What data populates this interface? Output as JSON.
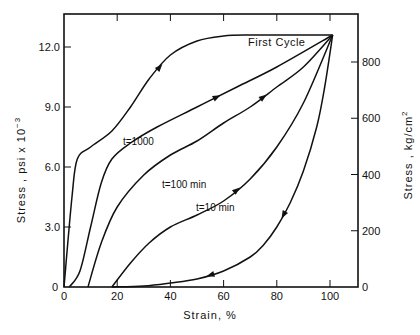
{
  "chart_data": {
    "type": "line",
    "title": "",
    "xlabel": "Strain, %",
    "ylabel": "Stress, psi x 10^-3",
    "ylabel_right": "Stress, kg/cm^2",
    "xlim": [
      0,
      110
    ],
    "ylim": [
      0,
      13.5
    ],
    "ylim_right": [
      0,
      949
    ],
    "x_ticks": [
      0,
      20,
      40,
      60,
      80,
      100
    ],
    "x_tick_labels": [
      "0",
      "20",
      "40",
      "60",
      "80",
      "100"
    ],
    "y_ticks": [
      0,
      3.0,
      6.0,
      9.0,
      12.0
    ],
    "y_tick_labels": [
      "0",
      "3.0",
      "6.0",
      "9.0",
      "12.0"
    ],
    "y_right_ticks": [
      0,
      200,
      400,
      600,
      800
    ],
    "y_right_tick_labels": [
      "0",
      "200",
      "400",
      "600",
      "800"
    ],
    "grid": false,
    "legend": "inline labels",
    "series": [
      {
        "name": "First Cycle",
        "label": "First Cycle",
        "x": [
          0,
          3,
          5,
          10,
          18,
          25,
          32,
          40,
          50,
          60,
          70,
          80,
          90,
          101
        ],
        "y": [
          0,
          4.5,
          6.4,
          7.0,
          7.8,
          9.0,
          10.4,
          11.6,
          12.3,
          12.55,
          12.6,
          12.6,
          12.6,
          12.6
        ]
      },
      {
        "name": "t=1000",
        "label": "t=1000",
        "x": [
          2,
          6,
          10,
          14,
          18,
          25,
          35,
          50,
          65,
          80,
          101
        ],
        "y": [
          0,
          0.8,
          3.0,
          5.2,
          6.4,
          7.2,
          8.0,
          9.0,
          10.0,
          11.0,
          12.6
        ]
      },
      {
        "name": "t=100 min",
        "label": "t=100 min",
        "x": [
          9,
          14,
          20,
          30,
          40,
          50,
          60,
          70,
          80,
          90,
          101
        ],
        "y": [
          0,
          2.2,
          4.0,
          5.6,
          6.6,
          7.3,
          8.2,
          9.0,
          10.0,
          11.0,
          12.6
        ]
      },
      {
        "name": "t=10 min",
        "label": "t=10 min",
        "x": [
          18,
          25,
          32,
          40,
          50,
          60,
          70,
          80,
          90,
          101
        ],
        "y": [
          0,
          1.2,
          2.2,
          3.0,
          3.6,
          4.3,
          5.4,
          7.0,
          9.2,
          12.6
        ]
      },
      {
        "name": "Unloading",
        "label": "",
        "x": [
          101,
          98,
          95,
          90,
          85,
          80,
          75,
          70,
          60,
          50,
          40,
          30,
          18
        ],
        "y": [
          12.6,
          10.0,
          8.0,
          5.8,
          4.2,
          3.0,
          2.1,
          1.5,
          0.8,
          0.4,
          0.2,
          0.05,
          0
        ]
      }
    ],
    "annotations": [
      "First Cycle",
      "t=1000",
      "t=100 min",
      "t=10 min"
    ]
  }
}
